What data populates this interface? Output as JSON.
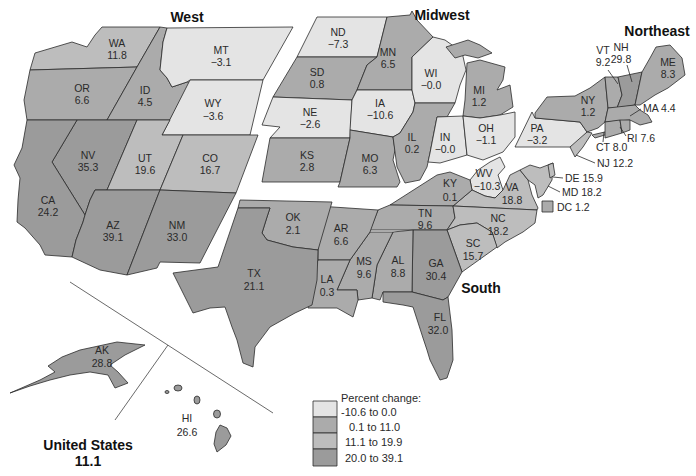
{
  "regions": {
    "west": "West",
    "midwest": "Midwest",
    "northeast": "Northeast",
    "south": "South"
  },
  "national": {
    "label": "United States",
    "value": "11.1"
  },
  "legend": {
    "title": "Percent change:",
    "items": [
      {
        "range": "-10.6 to 0.0",
        "color": "#e4e4e4"
      },
      {
        "range": "0.1 to 11.0",
        "color": "#ababab"
      },
      {
        "range": "11.1 to 19.9",
        "color": "#bdbdbd"
      },
      {
        "range": "20.0 to 39.1",
        "color": "#9b9b9b"
      }
    ]
  },
  "states": {
    "WA": {
      "abbr": "WA",
      "value": "11.8"
    },
    "OR": {
      "abbr": "OR",
      "value": "6.6"
    },
    "ID": {
      "abbr": "ID",
      "value": "4.5"
    },
    "MT": {
      "abbr": "MT",
      "value": "−3.1"
    },
    "WY": {
      "abbr": "WY",
      "value": "−3.6"
    },
    "NV": {
      "abbr": "NV",
      "value": "35.3"
    },
    "UT": {
      "abbr": "UT",
      "value": "19.6"
    },
    "CO": {
      "abbr": "CO",
      "value": "16.7"
    },
    "CA": {
      "abbr": "CA",
      "value": "24.2"
    },
    "AZ": {
      "abbr": "AZ",
      "value": "39.1"
    },
    "NM": {
      "abbr": "NM",
      "value": "33.0"
    },
    "ND": {
      "abbr": "ND",
      "value": "−7.3"
    },
    "SD": {
      "abbr": "SD",
      "value": "0.8"
    },
    "NE": {
      "abbr": "NE",
      "value": "−2.6"
    },
    "KS": {
      "abbr": "KS",
      "value": "2.8"
    },
    "MN": {
      "abbr": "MN",
      "value": "6.5"
    },
    "IA": {
      "abbr": "IA",
      "value": "−10.6"
    },
    "MO": {
      "abbr": "MO",
      "value": "6.3"
    },
    "WI": {
      "abbr": "WI",
      "value": "−0.0"
    },
    "IL": {
      "abbr": "IL",
      "value": "0.2"
    },
    "IN": {
      "abbr": "IN",
      "value": "−0.0"
    },
    "MI": {
      "abbr": "MI",
      "value": "1.2"
    },
    "OH": {
      "abbr": "OH",
      "value": "−1.1"
    },
    "PA": {
      "abbr": "PA",
      "value": "−3.2"
    },
    "NY": {
      "abbr": "NY",
      "value": "1.2"
    },
    "VT": {
      "abbr": "VT",
      "value": "9.2"
    },
    "NH": {
      "abbr": "NH",
      "value": "29.8"
    },
    "ME": {
      "abbr": "ME",
      "value": "8.3"
    },
    "MA": {
      "abbr": "MA",
      "value": "4.4"
    },
    "RI": {
      "abbr": "RI",
      "value": "7.6"
    },
    "CT": {
      "abbr": "CT",
      "value": "8.0"
    },
    "NJ": {
      "abbr": "NJ",
      "value": "12.2"
    },
    "DE": {
      "abbr": "DE",
      "value": "15.9"
    },
    "MD": {
      "abbr": "MD",
      "value": "18.2"
    },
    "DC": {
      "abbr": "DC",
      "value": "1.2"
    },
    "WV": {
      "abbr": "WV",
      "value": "−10.3"
    },
    "VA": {
      "abbr": "VA",
      "value": "18.8"
    },
    "KY": {
      "abbr": "KY",
      "value": "0.1"
    },
    "TN": {
      "abbr": "TN",
      "value": "9.6"
    },
    "NC": {
      "abbr": "NC",
      "value": "18.2"
    },
    "SC": {
      "abbr": "SC",
      "value": "15.7"
    },
    "GA": {
      "abbr": "GA",
      "value": "30.4"
    },
    "AL": {
      "abbr": "AL",
      "value": "8.8"
    },
    "MS": {
      "abbr": "MS",
      "value": "9.6"
    },
    "LA": {
      "abbr": "LA",
      "value": "0.3"
    },
    "AR": {
      "abbr": "AR",
      "value": "6.6"
    },
    "OK": {
      "abbr": "OK",
      "value": "2.1"
    },
    "TX": {
      "abbr": "TX",
      "value": "21.1"
    },
    "FL": {
      "abbr": "FL",
      "value": "32.0"
    },
    "AK": {
      "abbr": "AK",
      "value": "28.8"
    },
    "HI": {
      "abbr": "HI",
      "value": "26.6"
    }
  }
}
